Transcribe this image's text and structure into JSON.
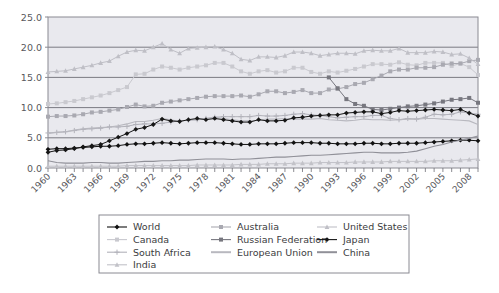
{
  "chart_data": {
    "type": "line",
    "title": "",
    "subtitle": "",
    "xlabel": "",
    "ylabel": "",
    "xlim": [
      1960,
      2009
    ],
    "ylim": [
      0.0,
      25.0
    ],
    "yticks": [
      "0.0",
      "5.0",
      "10.0",
      "15.0",
      "20.0",
      "25.0"
    ],
    "ytick_values": [
      0,
      5,
      10,
      15,
      20,
      25
    ],
    "grid": true,
    "grid_axis": "y",
    "legend_position": "bottom",
    "x": [
      1960,
      1961,
      1962,
      1963,
      1964,
      1965,
      1966,
      1967,
      1968,
      1969,
      1970,
      1971,
      1972,
      1973,
      1974,
      1975,
      1976,
      1977,
      1978,
      1979,
      1980,
      1981,
      1982,
      1983,
      1984,
      1985,
      1986,
      1987,
      1988,
      1989,
      1990,
      1991,
      1992,
      1993,
      1994,
      1995,
      1996,
      1997,
      1998,
      1999,
      2000,
      2001,
      2002,
      2003,
      2004,
      2005,
      2006,
      2007,
      2008,
      2009
    ],
    "xtick_labels": [
      "1960",
      "1963",
      "1966",
      "1969",
      "1972",
      "1975",
      "1978",
      "1981",
      "1984",
      "1987",
      "1990",
      "1993",
      "1996",
      "1999",
      "2002",
      "2005",
      "2008"
    ],
    "series": [
      {
        "name": "World",
        "color": "#111111",
        "marker": "diamond",
        "values": [
          3.1,
          3.2,
          3.2,
          3.3,
          3.4,
          3.5,
          3.6,
          3.6,
          3.7,
          3.9,
          4.0,
          4.0,
          4.1,
          4.2,
          4.1,
          4.0,
          4.1,
          4.2,
          4.2,
          4.2,
          4.1,
          4.0,
          3.9,
          3.9,
          4.0,
          4.0,
          4.0,
          4.1,
          4.2,
          4.2,
          4.2,
          4.1,
          4.1,
          4.0,
          4.0,
          4.0,
          4.1,
          4.1,
          4.0,
          4.0,
          4.1,
          4.1,
          4.1,
          4.2,
          4.3,
          4.4,
          4.5,
          4.6,
          4.6,
          4.5
        ]
      },
      {
        "name": "Canada",
        "color": "#c9c9cf",
        "marker": "square",
        "values": [
          10.6,
          10.7,
          10.9,
          11.1,
          11.4,
          11.7,
          12.0,
          12.4,
          12.9,
          13.4,
          15.5,
          15.6,
          16.3,
          16.8,
          16.6,
          16.3,
          16.6,
          16.8,
          17.0,
          17.4,
          17.4,
          16.8,
          16.0,
          15.6,
          16.0,
          16.2,
          15.8,
          16.0,
          16.6,
          16.6,
          15.9,
          15.6,
          16.0,
          15.8,
          16.1,
          16.4,
          16.8,
          17.2,
          17.2,
          17.1,
          17.5,
          17.1,
          17.0,
          17.4,
          17.4,
          17.4,
          16.9,
          17.3,
          16.7,
          15.4
        ]
      },
      {
        "name": "South Africa",
        "color": "#b2b2ba",
        "marker": "plus",
        "values": [
          5.8,
          5.9,
          6.0,
          6.2,
          6.4,
          6.5,
          6.6,
          6.8,
          6.8,
          6.9,
          7.2,
          7.3,
          7.3,
          7.4,
          7.6,
          7.8,
          7.9,
          8.0,
          8.2,
          8.4,
          8.5,
          8.5,
          8.5,
          8.5,
          8.7,
          8.6,
          8.6,
          8.7,
          8.9,
          9.0,
          8.8,
          8.7,
          8.5,
          8.3,
          8.4,
          8.5,
          8.5,
          8.7,
          8.7,
          8.2,
          8.0,
          8.2,
          8.1,
          8.4,
          8.9,
          8.8,
          8.9,
          9.3,
          9.1,
          8.9
        ]
      },
      {
        "name": "India",
        "color": "#c2c2c8",
        "marker": "triangle",
        "values": [
          0.3,
          0.3,
          0.3,
          0.3,
          0.3,
          0.3,
          0.3,
          0.3,
          0.3,
          0.4,
          0.4,
          0.4,
          0.4,
          0.4,
          0.4,
          0.4,
          0.4,
          0.5,
          0.5,
          0.5,
          0.5,
          0.5,
          0.6,
          0.6,
          0.6,
          0.7,
          0.7,
          0.7,
          0.8,
          0.8,
          0.8,
          0.9,
          0.9,
          0.9,
          0.9,
          1.0,
          1.0,
          1.0,
          1.0,
          1.1,
          1.1,
          1.1,
          1.1,
          1.1,
          1.2,
          1.2,
          1.2,
          1.3,
          1.4,
          1.5
        ]
      },
      {
        "name": "Australia",
        "color": "#a9a9b1",
        "marker": "square",
        "values": [
          8.5,
          8.6,
          8.6,
          8.7,
          8.9,
          9.2,
          9.3,
          9.5,
          9.7,
          10.1,
          10.5,
          10.2,
          10.3,
          10.8,
          11.0,
          11.2,
          11.4,
          11.6,
          11.8,
          11.9,
          11.9,
          11.9,
          12.0,
          11.8,
          12.2,
          12.7,
          12.7,
          12.4,
          12.6,
          12.9,
          12.4,
          12.4,
          13.0,
          13.1,
          13.4,
          13.9,
          14.1,
          14.7,
          15.3,
          16.0,
          16.3,
          16.3,
          16.6,
          16.6,
          16.7,
          17.1,
          17.3,
          17.3,
          17.7,
          17.9
        ]
      },
      {
        "name": "Russian Federation",
        "color": "#77777f",
        "marker": "square",
        "values": [
          null,
          null,
          null,
          null,
          null,
          null,
          null,
          null,
          null,
          null,
          null,
          null,
          null,
          null,
          null,
          null,
          null,
          null,
          null,
          null,
          null,
          null,
          null,
          null,
          null,
          null,
          null,
          null,
          null,
          null,
          null,
          null,
          15.0,
          13.2,
          11.4,
          10.6,
          10.3,
          9.7,
          9.6,
          9.8,
          10.0,
          10.2,
          10.3,
          10.5,
          10.7,
          11.0,
          11.3,
          11.4,
          11.6,
          10.8
        ]
      },
      {
        "name": "European Union",
        "color": "#b8b8bf",
        "marker": "none",
        "values": [
          5.7,
          5.9,
          6.0,
          6.3,
          6.5,
          6.6,
          6.7,
          6.8,
          7.0,
          7.3,
          7.7,
          7.7,
          7.9,
          8.2,
          8.0,
          7.7,
          8.0,
          8.0,
          8.2,
          8.4,
          8.2,
          8.0,
          7.8,
          7.8,
          7.9,
          8.1,
          8.1,
          8.2,
          8.1,
          8.1,
          8.1,
          8.2,
          8.0,
          7.9,
          7.8,
          7.9,
          8.1,
          8.0,
          8.0,
          7.9,
          8.0,
          8.1,
          8.1,
          8.2,
          8.2,
          8.1,
          8.0,
          7.9,
          7.8,
          7.2
        ]
      },
      {
        "name": "United States",
        "color": "#bfbfc6",
        "marker": "triangle",
        "values": [
          15.9,
          16.0,
          16.1,
          16.4,
          16.7,
          17.0,
          17.4,
          17.7,
          18.5,
          19.2,
          19.5,
          19.4,
          20.0,
          20.6,
          19.6,
          19.0,
          19.8,
          19.9,
          20.0,
          20.1,
          19.6,
          19.0,
          18.0,
          17.8,
          18.4,
          18.4,
          18.3,
          18.6,
          19.2,
          19.2,
          19.0,
          18.6,
          18.8,
          19.0,
          19.0,
          18.9,
          19.4,
          19.5,
          19.4,
          19.4,
          19.8,
          19.1,
          19.1,
          19.1,
          19.3,
          19.2,
          18.8,
          18.9,
          18.2,
          17.2
        ]
      },
      {
        "name": "Japan",
        "color": "#161616",
        "marker": "diamond",
        "values": [
          2.6,
          2.9,
          3.0,
          3.2,
          3.5,
          3.7,
          3.9,
          4.5,
          5.1,
          5.7,
          6.4,
          6.7,
          7.2,
          8.1,
          7.8,
          7.7,
          8.0,
          8.2,
          8.0,
          8.2,
          8.0,
          7.8,
          7.6,
          7.6,
          8.0,
          7.8,
          7.8,
          7.9,
          8.3,
          8.4,
          8.6,
          8.7,
          8.8,
          8.8,
          9.1,
          9.2,
          9.3,
          9.3,
          9.0,
          9.2,
          9.5,
          9.4,
          9.5,
          9.6,
          9.7,
          9.6,
          9.5,
          9.7,
          9.1,
          8.6
        ]
      },
      {
        "name": "China",
        "color": "#909098",
        "marker": "none",
        "values": [
          1.2,
          0.9,
          0.8,
          0.8,
          0.8,
          0.9,
          0.9,
          0.8,
          0.8,
          0.9,
          1.0,
          1.1,
          1.1,
          1.2,
          1.2,
          1.3,
          1.3,
          1.4,
          1.5,
          1.5,
          1.5,
          1.4,
          1.5,
          1.5,
          1.6,
          1.7,
          1.8,
          1.8,
          1.9,
          2.0,
          2.1,
          2.1,
          2.2,
          2.3,
          2.4,
          2.5,
          2.6,
          2.6,
          2.5,
          2.5,
          2.5,
          2.6,
          2.8,
          3.2,
          3.6,
          3.9,
          4.3,
          4.6,
          4.9,
          5.3
        ]
      }
    ]
  },
  "legend": {
    "entries": [
      {
        "label": "World",
        "marker": "diamond",
        "color": "#111111"
      },
      {
        "label": "Australia",
        "marker": "square",
        "color": "#a9a9b1"
      },
      {
        "label": "United States",
        "marker": "triangle",
        "color": "#bfbfc6"
      },
      {
        "label": "Canada",
        "marker": "square",
        "color": "#c9c9cf"
      },
      {
        "label": "Russian Federation",
        "marker": "square",
        "color": "#77777f"
      },
      {
        "label": "Japan",
        "marker": "diamond",
        "color": "#161616"
      },
      {
        "label": "South Africa",
        "marker": "plus",
        "color": "#b2b2ba"
      },
      {
        "label": "European Union",
        "marker": "none",
        "color": "#b8b8bf"
      },
      {
        "label": "China",
        "marker": "none",
        "color": "#909098"
      },
      {
        "label": "India",
        "marker": "triangle",
        "color": "#c2c2c8"
      }
    ]
  },
  "style": {
    "plot_background": "#e9e9ee",
    "page_background": "#ffffff",
    "grid_color": "#6e6e76",
    "frame_color": "#8a8a92",
    "axis_text_color": "#58585c",
    "legend_border": "#8a8a92"
  }
}
